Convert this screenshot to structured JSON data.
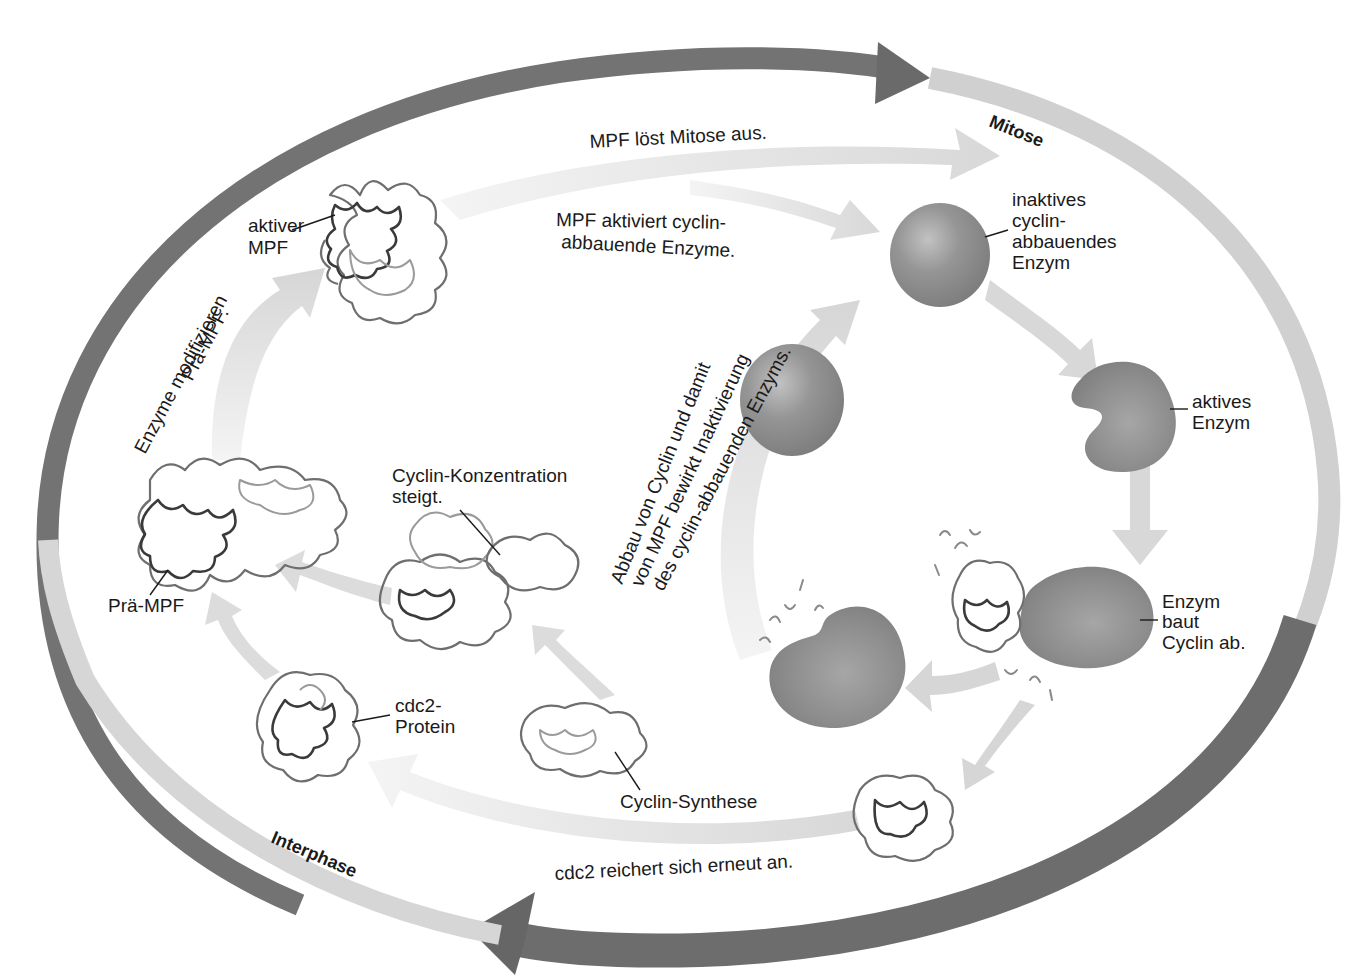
{
  "diagram": {
    "colors": {
      "outer_ring_dark": "#6f6f6f",
      "outer_ring_light": "#d4d4d4",
      "inner_arrow": "#dedede",
      "enzyme": "#8c8c8c",
      "enzyme_highlight": "#bdbdbd",
      "text": "#1a1a1a",
      "background": "#ffffff"
    },
    "phases": {
      "mitose": "Mitose",
      "interphase": "Interphase"
    },
    "arrow_labels": {
      "mpf_triggers_mitosis": "MPF löst Mitose aus.",
      "mpf_activates_line1": "MPF aktiviert cyclin-",
      "mpf_activates_line2": "abbauende Enzyme.",
      "enzymes_modify_line1": "Enzyme modifizieren",
      "enzymes_modify_line2": "Prä-MPF.",
      "degradation_line1": "Abbau von Cyclin und damit",
      "degradation_line2": "von MPF bewirkt Inaktivierung",
      "degradation_line3": "des cyclin-abbauenden Enzyms.",
      "cdc2_accumulates": "cdc2 reichert sich erneut an."
    },
    "structure_labels": {
      "active_mpf_line1": "aktiver",
      "active_mpf_line2": "MPF",
      "pre_mpf": "Prä-MPF",
      "cyclin_conc_line1": "Cyclin-Konzentration",
      "cyclin_conc_line2": "steigt.",
      "cdc2_line1": "cdc2-",
      "cdc2_line2": "Protein",
      "cyclin_synthesis": "Cyclin-Synthese",
      "inactive_enzyme_line1": "inaktives",
      "inactive_enzyme_line2": "cyclin-",
      "inactive_enzyme_line3": "abbauendes",
      "inactive_enzyme_line4": "Enzym",
      "active_enzyme_line1": "aktives",
      "active_enzyme_line2": "Enzym",
      "enzyme_degrades_line1": "Enzym",
      "enzyme_degrades_line2": "baut",
      "enzyme_degrades_line3": "Cyclin ab."
    },
    "nodes": [
      {
        "id": "active-mpf",
        "type": "protein-complex"
      },
      {
        "id": "pre-mpf",
        "type": "protein-complex"
      },
      {
        "id": "cyclin-rising",
        "type": "protein-cluster"
      },
      {
        "id": "cdc2-protein",
        "type": "protein"
      },
      {
        "id": "cyclin-synthesis",
        "type": "protein"
      },
      {
        "id": "inactive-enzyme",
        "type": "enzyme-sphere"
      },
      {
        "id": "active-enzyme",
        "type": "enzyme-kidney"
      },
      {
        "id": "enzyme-degrading-cyclin",
        "type": "enzyme-kidney-with-cyclin"
      },
      {
        "id": "spent-enzyme",
        "type": "enzyme-kidney"
      },
      {
        "id": "reinactivated-enzyme",
        "type": "enzyme-sphere"
      },
      {
        "id": "free-cdc2",
        "type": "protein"
      }
    ]
  }
}
